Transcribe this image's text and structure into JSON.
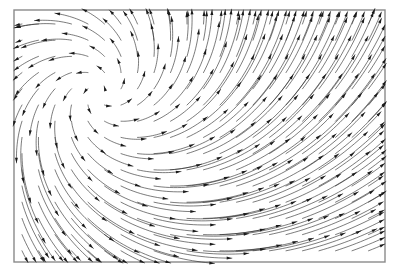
{
  "figure": {
    "title": "",
    "background_color": "#ffffff",
    "frame_color": "#8a8a8a",
    "arrow_color": "#2b2b2b",
    "arrowhead_color": "#1a1a1a"
  },
  "chart_data": {
    "type": "scatter",
    "subtype": "vector-field",
    "title": "",
    "subtitle": "",
    "xlabel": "",
    "ylabel": "",
    "xlim": [
      0,
      371
    ],
    "ylim": [
      0,
      248
    ],
    "grid": false,
    "legend": null,
    "tick_labels_x": [],
    "tick_labels_y": [],
    "annotations": [],
    "frame": {
      "x": 14,
      "y": 10,
      "width": 371,
      "height": 252
    },
    "plot_area": {
      "x": 14,
      "y": 10,
      "width": 371,
      "height": 252
    },
    "field": {
      "description": "Spiral source vector field: arrows emanate counterclockwise outward from a critical point, lengthening with radial distance.",
      "critical_point": {
        "x": 100,
        "y": 92,
        "type": "spiral-source"
      },
      "grid_spacing_x": 16.5,
      "grid_spacing_y": 16.2,
      "grid_origin_x": 22,
      "grid_origin_y": 24,
      "grid_cols": 23,
      "grid_rows": 15,
      "rotation_sign": -1,
      "radial_gain": 0.78,
      "tangential_gain": 1.0,
      "length_scale": 0.4,
      "max_length": 62,
      "min_length": 1.5,
      "curvature": 0.42,
      "arrowhead_length": 5.2,
      "arrowhead_width": 3.0,
      "stroke_width": 0.62
    }
  }
}
